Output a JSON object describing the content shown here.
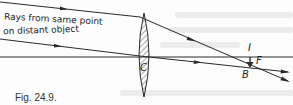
{
  "figure": {
    "caption": "Fig. 24.9.",
    "annotation_line1": "Rays from same point",
    "annotation_line2": "on distant object",
    "labels": {
      "lens_center": "C",
      "image_point": "B",
      "focal_point": "F",
      "image_label": "I"
    },
    "colors": {
      "ink": "#2a2a2a",
      "lens_hatch": "#555555",
      "background": "#fdfdfd"
    }
  }
}
